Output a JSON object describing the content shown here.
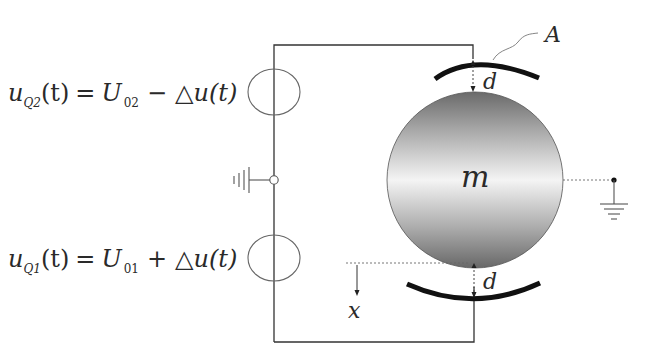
{
  "diagram": {
    "type": "electrostatic suspension circuit",
    "sources": {
      "upper": {
        "symbol": "u",
        "subscript": "Q2",
        "arg": "(t)",
        "equals": "=",
        "rhs_symbol": "U",
        "rhs_subscript": "02",
        "operator": "−",
        "delta": "△",
        "delta_term": "u(t)"
      },
      "lower": {
        "symbol": "u",
        "subscript": "Q1",
        "arg": "(t)",
        "equals": "=",
        "rhs_symbol": "U",
        "rhs_subscript": "01",
        "operator": "+",
        "delta": "△",
        "delta_term": "u(t)"
      }
    },
    "labels": {
      "mass": "m",
      "electrode": "A",
      "gap_top": "d",
      "gap_bottom": "d",
      "displacement": "x"
    },
    "colors": {
      "line": "#333333",
      "electrode": "#111111",
      "sphere_dark": "#6e6e6e",
      "sphere_light": "#f2f2f2",
      "text": "#2a2a2a"
    }
  }
}
